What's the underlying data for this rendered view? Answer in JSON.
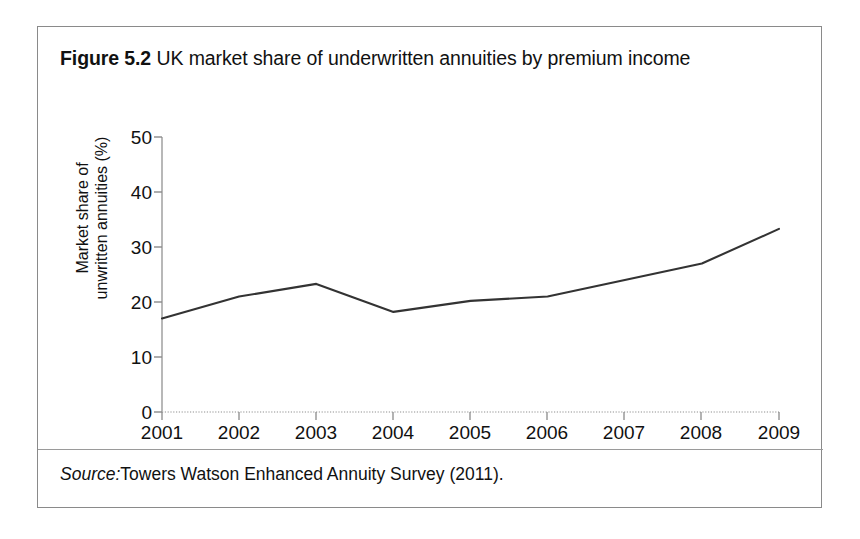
{
  "figure": {
    "label": "Figure 5.2",
    "title": "UK market share of underwritten annuities by premium income",
    "source_label": "Source:",
    "source_text": "Towers Watson Enhanced Annuity Survey (2011)."
  },
  "chart_data": {
    "type": "line",
    "title": "UK market share of underwritten annuities by premium income",
    "xlabel": "",
    "ylabel": "Market share of\nunwritten annuities (%)",
    "categories": [
      "2001",
      "2002",
      "2003",
      "2004",
      "2005",
      "2006",
      "2007",
      "2008",
      "2009"
    ],
    "x": [
      2001,
      2002,
      2003,
      2004,
      2005,
      2006,
      2007,
      2008,
      2009
    ],
    "values": [
      17.0,
      21.0,
      23.3,
      18.2,
      20.2,
      21.0,
      24.0,
      27.0,
      33.3
    ],
    "series": [
      {
        "name": "Market share of underwritten annuities",
        "values": [
          17.0,
          21.0,
          23.3,
          18.2,
          20.2,
          21.0,
          24.0,
          27.0,
          33.3
        ]
      }
    ],
    "xtick_labels": [
      "2001",
      "2002",
      "2003",
      "2004",
      "2005",
      "2006",
      "2007",
      "2008",
      "2009"
    ],
    "ytick_labels": [
      "0",
      "10",
      "20",
      "30",
      "40",
      "50"
    ],
    "yticks": [
      0,
      10,
      20,
      30,
      40,
      50
    ],
    "ylim": [
      0,
      50
    ],
    "xlim": [
      2001,
      2009
    ],
    "grid": false,
    "legend": "none",
    "line_color": "#333333",
    "axis_color": "#9a9a9a",
    "background": "#ffffff"
  }
}
